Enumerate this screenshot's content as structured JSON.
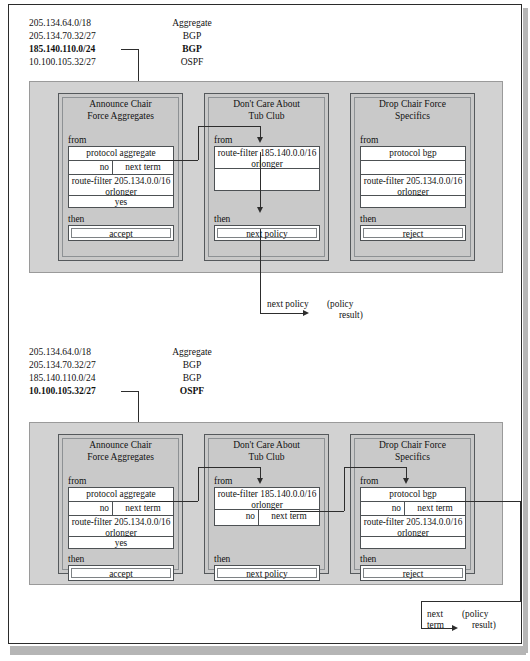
{
  "figure": {
    "colors": {
      "panel_bg": "#d2d2d2",
      "policy_bg": "#c9c9c9",
      "cell_bg": "#ffffff",
      "line": "#2d2d2d",
      "page_border": "#2b2b2b"
    },
    "keywords": {
      "from": "from",
      "then": "then"
    },
    "labels": {
      "yes": "yes",
      "no": "no",
      "next_term": "next term",
      "policy_result": "(policy\nresult)"
    }
  },
  "panel1": {
    "routes": [
      {
        "prefix": "205.134.64.0/18",
        "protocol": "Aggregate",
        "bold": false
      },
      {
        "prefix": "205.134.70.32/27",
        "protocol": "BGP",
        "bold": false
      },
      {
        "prefix": "185.140.110.0/24",
        "protocol": "BGP",
        "bold": true
      },
      {
        "prefix": "10.100.105.32/27",
        "protocol": "OSPF",
        "bold": false
      }
    ],
    "policies": [
      {
        "title": "Announce Chair\nForce Aggregates",
        "from_label": "from",
        "then_label": "then",
        "rows": [
          {
            "type": "full",
            "text": "protocol aggregate"
          },
          {
            "type": "split",
            "left": "no",
            "right": "next term"
          },
          {
            "type": "full2",
            "line1": "route-filter 205.134.0.0/16",
            "line2": "orlonger"
          },
          {
            "type": "full",
            "text": "yes"
          }
        ],
        "then_value": "accept"
      },
      {
        "title": "Don't Care About\nTub Club",
        "from_label": "from",
        "then_label": "then",
        "rows": [
          {
            "type": "full2",
            "line1": "route-filter 185.140.0.0/16",
            "line2": "orlonger"
          },
          {
            "type": "blank",
            "text": ""
          }
        ],
        "then_value": "next policy"
      },
      {
        "title": "Drop Chair Force\nSpecifics",
        "from_label": "from",
        "then_label": "then",
        "rows": [
          {
            "type": "full",
            "text": "protocol bgp"
          },
          {
            "type": "blank",
            "text": ""
          },
          {
            "type": "full2",
            "line1": "route-filter 205.134.0.0/16",
            "line2": "orlonger"
          },
          {
            "type": "blank",
            "text": ""
          }
        ],
        "then_value": "reject"
      }
    ],
    "result": {
      "action": "next policy",
      "caption_line1": "(policy",
      "caption_line2": "result)"
    }
  },
  "panel2": {
    "routes": [
      {
        "prefix": "205.134.64.0/18",
        "protocol": "Aggregate",
        "bold": false
      },
      {
        "prefix": "205.134.70.32/27",
        "protocol": "BGP",
        "bold": false
      },
      {
        "prefix": "185.140.110.0/24",
        "protocol": "BGP",
        "bold": false
      },
      {
        "prefix": "10.100.105.32/27",
        "protocol": "OSPF",
        "bold": true
      }
    ],
    "policies": [
      {
        "title": "Announce Chair\nForce Aggregates",
        "from_label": "from",
        "then_label": "then",
        "rows": [
          {
            "type": "full",
            "text": "protocol aggregate"
          },
          {
            "type": "split",
            "left": "no",
            "right": "next term"
          },
          {
            "type": "full2",
            "line1": "route-filter 205.134.0.0/16",
            "line2": "orlonger"
          },
          {
            "type": "full",
            "text": "yes"
          }
        ],
        "then_value": "accept"
      },
      {
        "title": "Don't Care About\nTub Club",
        "from_label": "from",
        "then_label": "then",
        "rows": [
          {
            "type": "full2",
            "line1": "route-filter 185.140.0.0/16",
            "line2": "orlonger"
          },
          {
            "type": "split",
            "left": "no",
            "right": "next term"
          }
        ],
        "then_value": "next policy"
      },
      {
        "title": "Drop Chair Force\nSpecifics",
        "from_label": "from",
        "then_label": "then",
        "rows": [
          {
            "type": "full",
            "text": "protocol bgp"
          },
          {
            "type": "split",
            "left": "no",
            "right": "next term"
          },
          {
            "type": "full2",
            "line1": "route-filter 205.134.0.0/16",
            "line2": "orlonger"
          },
          {
            "type": "blank",
            "text": ""
          }
        ],
        "then_value": "reject"
      }
    ],
    "result": {
      "action_line1": "next",
      "action_line2": "term",
      "caption_line1": "(policy",
      "caption_line2": "result)"
    }
  }
}
